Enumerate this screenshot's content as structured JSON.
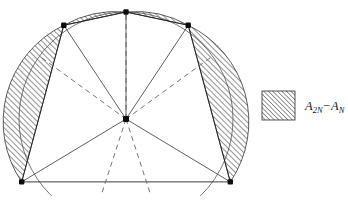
{
  "figure": {
    "background_color": "#ffffff",
    "stroke_color": "#1a1a1a",
    "hatch_color": "#3a3a3a",
    "circle": {
      "center_x": 126,
      "center_y": 119,
      "radius": 107,
      "style": "solid-thin",
      "visible_arc_degrees": 300
    },
    "polygon_inner": {
      "name": "N-gon chords",
      "sides_visible": 5,
      "vertex_count_on_circle": 5,
      "style": "solid"
    },
    "polygon_outer": {
      "name": "2N-gon",
      "note": "midpoint vertices shown via dashed radii"
    },
    "vertices": [
      {
        "id": "v-top",
        "label": "top vertex",
        "x": 126,
        "y": 12,
        "angle_deg": 90
      },
      {
        "id": "v-upper-left",
        "label": "upper left vertex",
        "x": 63,
        "y": 25,
        "angle_deg": 154
      },
      {
        "id": "v-upper-right",
        "label": "upper right vertex",
        "x": 184,
        "y": 27,
        "angle_deg": 26
      },
      {
        "id": "v-lower-left",
        "label": "lower left vertex",
        "x": 20,
        "y": 140,
        "angle_deg": 218
      },
      {
        "id": "v-lower-right",
        "label": "lower right vertex",
        "x": 231,
        "y": 140,
        "angle_deg": 322
      }
    ],
    "center_point": {
      "id": "center",
      "label": "circle center",
      "x": 126,
      "y": 119
    },
    "radii_solid": [
      {
        "from": "center",
        "to": "v-top"
      },
      {
        "from": "center",
        "to": "v-upper-left"
      },
      {
        "from": "center",
        "to": "v-upper-right"
      },
      {
        "from": "center",
        "to": "v-lower-left"
      },
      {
        "from": "center",
        "to": "v-lower-right"
      }
    ],
    "radii_dashed": [
      {
        "id": "dashed-radius-vertical",
        "angle_deg": 90,
        "note": "to midpoint of top arc span"
      },
      {
        "id": "dashed-radius-upper-left",
        "angle_deg": 144
      },
      {
        "id": "dashed-radius-upper-right",
        "angle_deg": 36
      },
      {
        "id": "dashed-radius-lower-left",
        "angle_deg": 252
      },
      {
        "id": "dashed-radius-lower-right",
        "angle_deg": 288
      }
    ],
    "hatched_segments": [
      {
        "id": "segment-top-left",
        "chord_from": "v-upper-left",
        "chord_to": "v-top"
      },
      {
        "id": "segment-top-right",
        "chord_from": "v-top",
        "chord_to": "v-upper-right"
      },
      {
        "id": "segment-left",
        "chord_from": "v-lower-left",
        "chord_to": "v-upper-left"
      },
      {
        "id": "segment-right",
        "chord_from": "v-upper-right",
        "chord_to": "v-lower-right"
      }
    ]
  },
  "legend": {
    "swatch": {
      "name": "hatched-swatch",
      "pattern": "diagonal-hatch",
      "x": 262,
      "y": 91,
      "width": 33,
      "height": 29
    },
    "label_prefix": "A",
    "label_sub_1": "2N",
    "label_minus": "−",
    "label_main_2": "A",
    "label_sub_2": "N",
    "label_plain": "A2N−AN"
  }
}
